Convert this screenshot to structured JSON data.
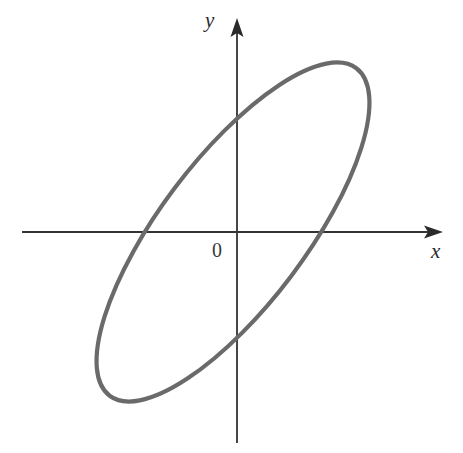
{
  "figure": {
    "background_color": "#ffffff",
    "width": 463,
    "height": 453
  },
  "axes": {
    "origin_label": "0",
    "x_label": "x",
    "y_label": "y",
    "axis_color": "#333333",
    "axis_stroke_width": 1.8,
    "origin_px": {
      "x": 237,
      "y": 232
    },
    "x_axis": {
      "name": "x-axis",
      "start_px": {
        "x": 22,
        "y": 232
      },
      "end_px": {
        "x": 443,
        "y": 232
      },
      "arrow": "right"
    },
    "y_axis": {
      "name": "y-axis",
      "start_px": {
        "x": 237,
        "y": 443
      },
      "end_px": {
        "x": 237,
        "y": 18
      },
      "arrow": "up"
    }
  },
  "chart_data": {
    "type": "line",
    "xlabel": "x",
    "ylabel": "y",
    "grid": false,
    "legend": "none",
    "annotations": [
      "0"
    ],
    "curves": [
      {
        "name": "ellipse",
        "shape": "ellipse",
        "stroke_color": "#6a6a6a",
        "stroke_width": 4.2,
        "fill": "none",
        "center_px": {
          "x": 233,
          "y": 232
        },
        "semi_major_axis_px": 205,
        "semi_minor_axis_px": 73,
        "rotation_deg": -53,
        "bounding_box_px": {
          "left": 78,
          "top": 71,
          "right": 389,
          "bottom": 394
        },
        "x_axis_intersections_px": [
          {
            "x": 144,
            "y": 232
          },
          {
            "x": 330,
            "y": 232
          }
        ],
        "y_axis_intersections_px": [
          {
            "x": 237,
            "y": 139
          },
          {
            "x": 237,
            "y": 330
          }
        ]
      }
    ]
  }
}
